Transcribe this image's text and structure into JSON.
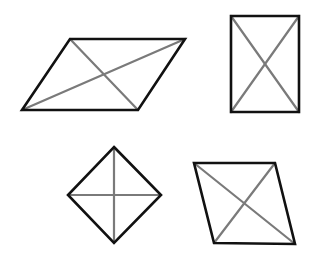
{
  "diagram": {
    "title": "",
    "background": "#ffffff",
    "outline_color": "#111111",
    "diagonal_color": "#7a7a7a",
    "shapes": [
      {
        "name": "parallelogram",
        "label": "",
        "vertices": [
          [
            70,
            39
          ],
          [
            185,
            39
          ],
          [
            138,
            110
          ],
          [
            22,
            110
          ]
        ],
        "diagonals": [
          [
            [
              70,
              39
            ],
            [
              138,
              110
            ]
          ],
          [
            [
              22,
              110
            ],
            [
              185,
              39
            ]
          ]
        ]
      },
      {
        "name": "rectangle",
        "label": "",
        "vertices": [
          [
            231,
            16
          ],
          [
            299,
            16
          ],
          [
            299,
            112
          ],
          [
            231,
            112
          ]
        ],
        "diagonals": [
          [
            [
              231,
              16
            ],
            [
              299,
              112
            ]
          ],
          [
            [
              299,
              16
            ],
            [
              231,
              112
            ]
          ]
        ]
      },
      {
        "name": "square-rhombus",
        "label": "",
        "vertices": [
          [
            114,
            147
          ],
          [
            161,
            195
          ],
          [
            114,
            243
          ],
          [
            68,
            195
          ]
        ],
        "diagonals": [
          [
            [
              114,
              147
            ],
            [
              114,
              243
            ]
          ],
          [
            [
              68,
              195
            ],
            [
              161,
              195
            ]
          ]
        ]
      },
      {
        "name": "rhombus",
        "label": "",
        "vertices": [
          [
            194,
            163
          ],
          [
            275,
            163
          ],
          [
            295,
            244
          ],
          [
            214,
            243
          ]
        ],
        "diagonals": [
          [
            [
              194,
              163
            ],
            [
              295,
              244
            ]
          ],
          [
            [
              275,
              163
            ],
            [
              214,
              243
            ]
          ]
        ]
      }
    ]
  }
}
